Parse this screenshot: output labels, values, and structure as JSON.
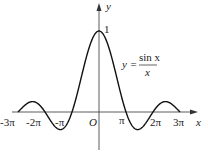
{
  "chart_data": {
    "type": "line",
    "title": "",
    "function": "y = sin x / x",
    "xlabel": "x",
    "ylabel": "y",
    "origin_label": "O",
    "x_tick_labels": [
      "-3π",
      "-2π",
      "-π",
      "π",
      "2π",
      "3π"
    ],
    "x_ticks": [
      -9.4248,
      -6.2832,
      -3.1416,
      3.1416,
      6.2832,
      9.4248
    ],
    "y_tick_labels": [
      "1"
    ],
    "y_ticks": [
      1
    ],
    "xlim": [
      -9.42,
      9.42
    ],
    "ylim": [
      -0.3,
      1.1
    ],
    "grid": false,
    "annotation": {
      "prefix": "y =",
      "numerator": "sin x",
      "denominator": "x"
    }
  }
}
